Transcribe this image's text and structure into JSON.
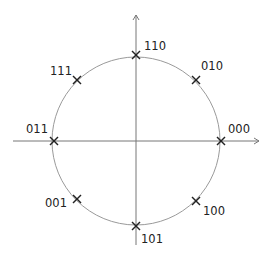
{
  "diagram": {
    "type": "constellation-8psk",
    "center": [
      136,
      141
    ],
    "radius": 84,
    "circle_color": "#9a9a9a",
    "axis_color": "#777777",
    "marker_color": "#222222",
    "x_axis": {
      "from": 13,
      "to": 259
    },
    "y_axis": {
      "from": 15,
      "to": 245
    },
    "points": [
      {
        "label": "000",
        "x": 221,
        "y": 141,
        "lx": 228,
        "ly": 133
      },
      {
        "label": "010",
        "x": 196,
        "y": 80,
        "lx": 201,
        "ly": 70
      },
      {
        "label": "110",
        "x": 136,
        "y": 55,
        "lx": 144,
        "ly": 50
      },
      {
        "label": "111",
        "x": 77,
        "y": 80,
        "lx": 50,
        "ly": 75
      },
      {
        "label": "011",
        "x": 54,
        "y": 141,
        "lx": 26,
        "ly": 133
      },
      {
        "label": "001",
        "x": 77,
        "y": 199,
        "lx": 45,
        "ly": 207
      },
      {
        "label": "101",
        "x": 136,
        "y": 226,
        "lx": 141,
        "ly": 243
      },
      {
        "label": "100",
        "x": 196,
        "y": 201,
        "lx": 203,
        "ly": 215
      }
    ]
  }
}
